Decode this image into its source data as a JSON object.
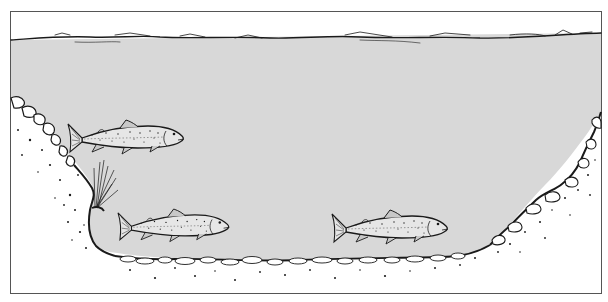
{
  "illustration": {
    "subject": "River channel cross-section with three trout",
    "colors": {
      "background": "#ffffff",
      "water": "#d8d8d8",
      "ink": "#1a1a1a",
      "frame": "#555555"
    },
    "frame": {
      "x": 10,
      "y": 11,
      "width": 592,
      "height": 283
    },
    "water_surface_y": 38,
    "fish": [
      {
        "label": "trout-upper-left",
        "x": 68,
        "y": 120,
        "length": 118
      },
      {
        "label": "trout-lower-left",
        "x": 118,
        "y": 210,
        "length": 112
      },
      {
        "label": "trout-lower-right",
        "x": 332,
        "y": 210,
        "length": 118
      }
    ],
    "features": [
      "water-surface",
      "left-bank-stones",
      "streambed-gravel",
      "right-bank-stones",
      "aquatic-plant"
    ]
  }
}
